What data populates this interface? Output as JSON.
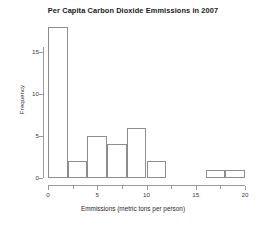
{
  "chart_data": {
    "type": "bar",
    "title": "Per Capita Carbon Dioxide Emmissions in 2007",
    "xlabel": "Emmissions (metric tons per person)",
    "ylabel": "Frequency",
    "grid": false,
    "legend": "none",
    "histogram": true,
    "bin_width": 2,
    "bin_edges": [
      0,
      2,
      4,
      6,
      8,
      10,
      12,
      14,
      16,
      18,
      20
    ],
    "categories": [
      "0-2",
      "2-4",
      "4-6",
      "6-8",
      "8-10",
      "10-12",
      "12-14",
      "14-16",
      "16-18",
      "18-20"
    ],
    "values": [
      18,
      2,
      5,
      4,
      6,
      2,
      0,
      0,
      1,
      1
    ],
    "xlim": [
      0,
      20
    ],
    "ylim": [
      0,
      18
    ],
    "x_ticks": [
      0,
      5,
      10,
      15,
      20
    ],
    "x_tick_labels": [
      "0",
      "5",
      "10",
      "15",
      "20"
    ],
    "x_minor_ticks": [
      2.5,
      7.5,
      12.5,
      17.5
    ],
    "y_ticks": [
      0,
      5,
      10,
      15
    ],
    "y_tick_labels": [
      "0",
      "5",
      "10",
      "15"
    ],
    "bar_fill_color": "#ffffff",
    "bar_edge_color": "#8d8d8d",
    "axis_color": "#9a9a9a",
    "background_color": "#ffffff"
  }
}
